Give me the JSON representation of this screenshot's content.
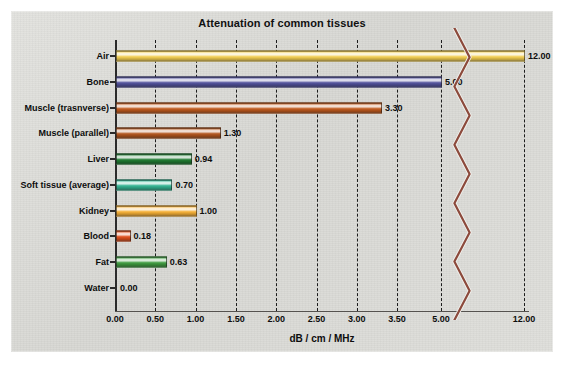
{
  "chart_data": {
    "type": "bar",
    "orientation": "horizontal",
    "title": "Attenuation of common tissues",
    "xlabel": "dB / cm / MHz",
    "ylabel": "",
    "grid": true,
    "legend": null,
    "axis_note": "broken x-axis between 3.50 and 5.00 and between 5.00 and 12.00",
    "xticks": [
      "0.00",
      "0.50",
      "1.00",
      "1.50",
      "2.00",
      "2.50",
      "3.00",
      "3.50",
      "5.00",
      "12.00"
    ],
    "xtick_values": [
      0.0,
      0.5,
      1.0,
      1.5,
      2.0,
      2.5,
      3.0,
      3.5,
      5.0,
      12.0
    ],
    "categories": [
      "Air",
      "Bone",
      "Muscle (trasnverse)",
      "Muscle (parallel)",
      "Liver",
      "Soft tissue (average)",
      "Kidney",
      "Blood",
      "Fat",
      "Water"
    ],
    "values": [
      12.0,
      5.0,
      3.3,
      1.3,
      0.94,
      0.7,
      1.0,
      0.18,
      0.63,
      0.0
    ],
    "value_labels": [
      "12.00",
      "5.00",
      "3.30",
      "1.30",
      "0.94",
      "0.70",
      "1.00",
      "0.18",
      "0.63",
      "0.00"
    ],
    "bar_colors": [
      "#f2ce52",
      "#52529c",
      "#c05a1e",
      "#b2561e",
      "#1f7a31",
      "#34b392",
      "#f5b037",
      "#e0501c",
      "#3f9b40",
      "#dcdcd8"
    ],
    "break_mark_color": "#8c4a3c"
  },
  "panel": {
    "background_color": "#dcdcd8"
  }
}
